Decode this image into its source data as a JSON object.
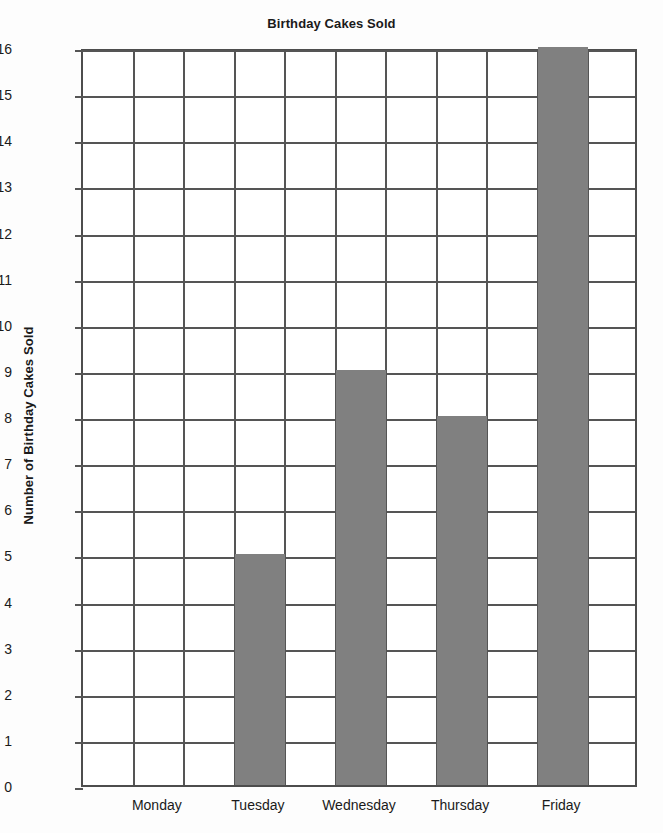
{
  "chart_data": {
    "type": "bar",
    "title": "Birthday Cakes Sold",
    "xlabel": "",
    "ylabel": "Number of Birthday Cakes Sold",
    "categories": [
      "Monday",
      "Tuesday",
      "Wednesday",
      "Thursday",
      "Friday"
    ],
    "values": [
      0,
      5,
      9,
      8,
      16
    ],
    "ylim": [
      0,
      16
    ],
    "ytick_step": 1,
    "yticks": [
      0,
      1,
      2,
      3,
      4,
      5,
      6,
      7,
      8,
      9,
      10,
      11,
      12,
      13,
      14,
      15,
      16
    ],
    "ytick_labels": [
      "0",
      "1",
      "2",
      "3",
      "4",
      "5",
      "6",
      "7",
      "8",
      "9",
      "10",
      "11",
      "12",
      "13",
      "14",
      "15",
      "16"
    ],
    "grid": true,
    "legend": null,
    "colors": {
      "bar_fill": "#808080",
      "grid_line": "#555555",
      "axis_line": "#4d4d4d",
      "background": "#ffffff",
      "page_background": "#fdfdfd",
      "text": "#1a1a1a"
    },
    "grid_columns": 11,
    "bar_columns": [
      4,
      6,
      8,
      10
    ],
    "category_columns": [
      2,
      4,
      6,
      8,
      10
    ]
  }
}
